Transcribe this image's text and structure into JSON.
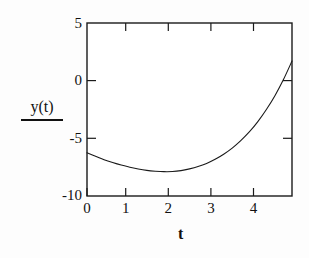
{
  "figure": {
    "background_color": "#fdfdfd",
    "ink_color": "#1a1a1a"
  },
  "chart_data": {
    "type": "line",
    "title": "",
    "subtitle": "",
    "xlabel": "t",
    "ylabel": "y(t)",
    "xlim": [
      0,
      4.8
    ],
    "ylim": [
      -10,
      5
    ],
    "grid": false,
    "legend": null,
    "legend_position": "none",
    "xticks": [
      0,
      1,
      2,
      3,
      4
    ],
    "xtick_labels": [
      "0",
      "1",
      "2",
      "3",
      "4"
    ],
    "yticks": [
      5,
      0,
      -5,
      -10
    ],
    "ytick_labels": [
      "5",
      "0",
      "-5",
      "-10"
    ],
    "ticks_on_all_sides": true,
    "series": [
      {
        "name": "y(t)",
        "color": "#1a1a1a",
        "line_width": 1.1,
        "x": [
          0.0,
          0.2,
          0.4,
          0.6,
          0.8,
          1.0,
          1.2,
          1.4,
          1.6,
          1.8,
          2.0,
          2.2,
          2.4,
          2.6,
          2.8,
          3.0,
          3.2,
          3.4,
          3.6,
          3.8,
          4.0,
          4.2,
          4.4,
          4.6,
          4.8
        ],
        "y": [
          -6.25,
          -6.55,
          -6.85,
          -7.1,
          -7.32,
          -7.5,
          -7.66,
          -7.78,
          -7.85,
          -7.89,
          -7.88,
          -7.8,
          -7.65,
          -7.45,
          -7.18,
          -6.82,
          -6.38,
          -5.85,
          -5.2,
          -4.45,
          -3.55,
          -2.5,
          -1.3,
          0.1,
          1.7
        ]
      }
    ],
    "annotations": []
  },
  "labels": {
    "y_top": "5",
    "y_zero": "0",
    "y_minus_five": "-5",
    "y_minus_ten": "-10",
    "x0": "0",
    "x1": "1",
    "x2": "2",
    "x3": "3",
    "x4": "4",
    "y_axis_title": "y(t)",
    "x_axis_title": "t"
  }
}
